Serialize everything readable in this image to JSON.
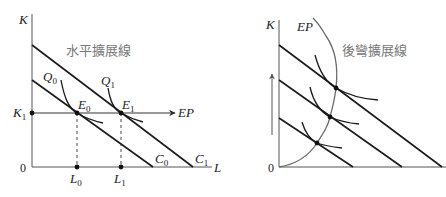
{
  "left_panel": {
    "title": "水平擴展線",
    "axis": {
      "y_label": "K",
      "x_label": "L",
      "origin": "0"
    },
    "budget_lines": [
      {
        "name": "C",
        "sub": "0"
      },
      {
        "name": "C",
        "sub": "1"
      }
    ],
    "isoquants": [
      {
        "name": "Q",
        "sub": "0"
      },
      {
        "name": "Q",
        "sub": "1"
      }
    ],
    "equilibria": [
      {
        "name": "E",
        "sub": "0",
        "L": {
          "name": "L",
          "sub": "0"
        }
      },
      {
        "name": "E",
        "sub": "1",
        "L": {
          "name": "L",
          "sub": "1"
        }
      }
    ],
    "k_level": {
      "name": "K",
      "sub": "1"
    },
    "expansion_path_label": "EP"
  },
  "right_panel": {
    "title": "後彎擴展線",
    "axis": {
      "y_label": "K",
      "origin": "0"
    },
    "expansion_path_label": "EP",
    "budget_line_count": 3,
    "isoquant_count": 3,
    "arrow": "up-arrow"
  },
  "colors": {
    "line": "#1a1a1a",
    "axis": "#555555",
    "ep_curve": "#6b6b6b",
    "title": "#777777"
  }
}
